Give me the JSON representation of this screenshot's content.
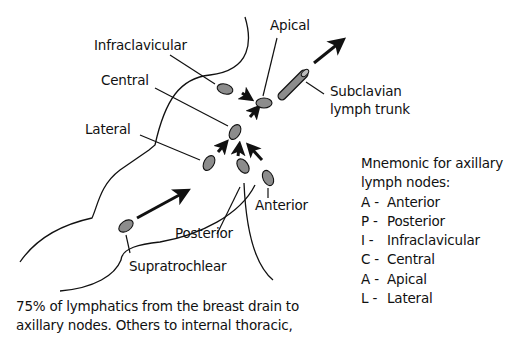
{
  "labels": {
    "infraclavicular": "Infraclavicular",
    "central": "Central",
    "lateral": "Lateral",
    "apical": "Apical",
    "subclavian_line1": "Subclavian",
    "subclavian_line2": "lymph trunk",
    "anterior": "Anterior",
    "posterior": "Posterior",
    "supratrochlear": "Supratrochlear"
  },
  "mnemonic": {
    "title_line1": "Mnemonic for axillary",
    "title_line2": "lymph nodes:",
    "items": [
      {
        "key": "A -",
        "value": "Anterior"
      },
      {
        "key": "P -",
        "value": "Posterior"
      },
      {
        "key": "I -",
        "value": "Infraclavicular"
      },
      {
        "key": "C -",
        "value": "Central"
      },
      {
        "key": "A -",
        "value": "Apical"
      },
      {
        "key": "L -",
        "value": "Lateral"
      }
    ]
  },
  "footer": {
    "line1": "75% of lymphatics from the breast drain to",
    "line2": "axillary nodes. Others to internal thoracic,"
  },
  "colors": {
    "node_fill": "#8c8c8c",
    "stroke": "#111111",
    "background": "#ffffff"
  }
}
